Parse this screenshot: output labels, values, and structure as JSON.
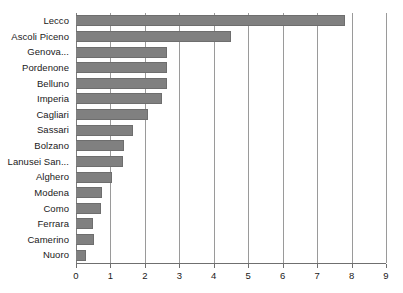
{
  "chart_data": {
    "type": "bar",
    "orientation": "horizontal",
    "title": "",
    "subtitle": "",
    "xlabel": "",
    "ylabel": "",
    "xlim": [
      0,
      9
    ],
    "ylim": null,
    "grid": true,
    "grid_axis": "x",
    "legend": false,
    "legend_position": "none",
    "xticks": [
      0,
      1,
      2,
      3,
      4,
      5,
      6,
      7,
      8,
      9
    ],
    "xtick_labels": [
      "0",
      "1",
      "2",
      "3",
      "4",
      "5",
      "6",
      "7",
      "8",
      "9"
    ],
    "categories": [
      "Lecco",
      "Ascoli Piceno",
      "Genova...",
      "Pordenone",
      "Belluno",
      "Imperia",
      "Cagliari",
      "Sassari",
      "Bolzano",
      "Lanusei San...",
      "Alghero",
      "Modena",
      "Como",
      "Ferrara",
      "Camerino",
      "Nuoro"
    ],
    "values": [
      7.8,
      4.5,
      2.65,
      2.65,
      2.65,
      2.5,
      2.1,
      1.65,
      1.4,
      1.35,
      1.05,
      0.75,
      0.73,
      0.5,
      0.52,
      0.3
    ],
    "series": [
      {
        "name": "",
        "values": [
          7.8,
          4.5,
          2.65,
          2.65,
          2.65,
          2.5,
          2.1,
          1.65,
          1.4,
          1.35,
          1.05,
          0.75,
          0.73,
          0.5,
          0.52,
          0.3
        ]
      }
    ],
    "colors": {
      "bar": "#808080",
      "bar_edge": "#6e6e6e",
      "gridline": "#9a9a9a",
      "axis": "#6f6f6f",
      "text": "#1a1a1a",
      "background": "#ffffff"
    }
  }
}
